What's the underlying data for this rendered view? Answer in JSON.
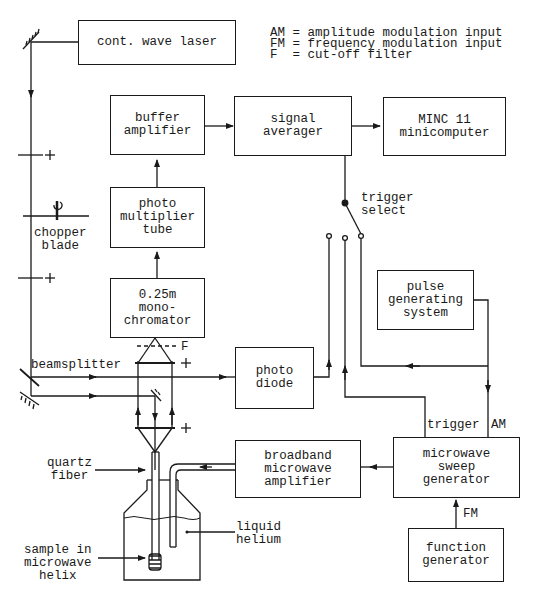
{
  "legend": [
    {
      "abbr": "AM",
      "text": "AM = amplitude modulation input"
    },
    {
      "abbr": "FM",
      "text": "FM = frequency modulation input"
    },
    {
      "abbr": "F",
      "text": "F  = cut-off filter"
    }
  ],
  "blocks": {
    "laser": "cont. wave laser",
    "buffer_amplifier": "buffer\namplifier",
    "signal_averager": "signal\naverager",
    "minicomputer": "MINC 11\nminicomputer",
    "photomultiplier": "photo\nmultiplier\ntube",
    "monochromator": "0.25m\nmono-\nchromator",
    "photodiode": "photo\ndiode",
    "pulse_generator": "pulse\ngenerating\nsystem",
    "microwave_amplifier": "broadband\nmicrowave\namplifier",
    "sweep_generator": "microwave\nsweep\ngenerator",
    "function_generator": "function\ngenerator"
  },
  "labels": {
    "chopper": "chopper\nblade",
    "trigger_select": "trigger\nselect",
    "beamsplitter": "beamsplitter",
    "filter": "F",
    "lens_plus": "+",
    "quartz_fiber": "quartz\nfiber",
    "liquid_helium": "liquid\nhelium",
    "sample": "sample in\nmicrowave\nhelix",
    "trigger": "trigger",
    "am": "AM",
    "fm": "FM"
  },
  "colors": {
    "ink": "#1a1a1a",
    "background": "#ffffff"
  }
}
